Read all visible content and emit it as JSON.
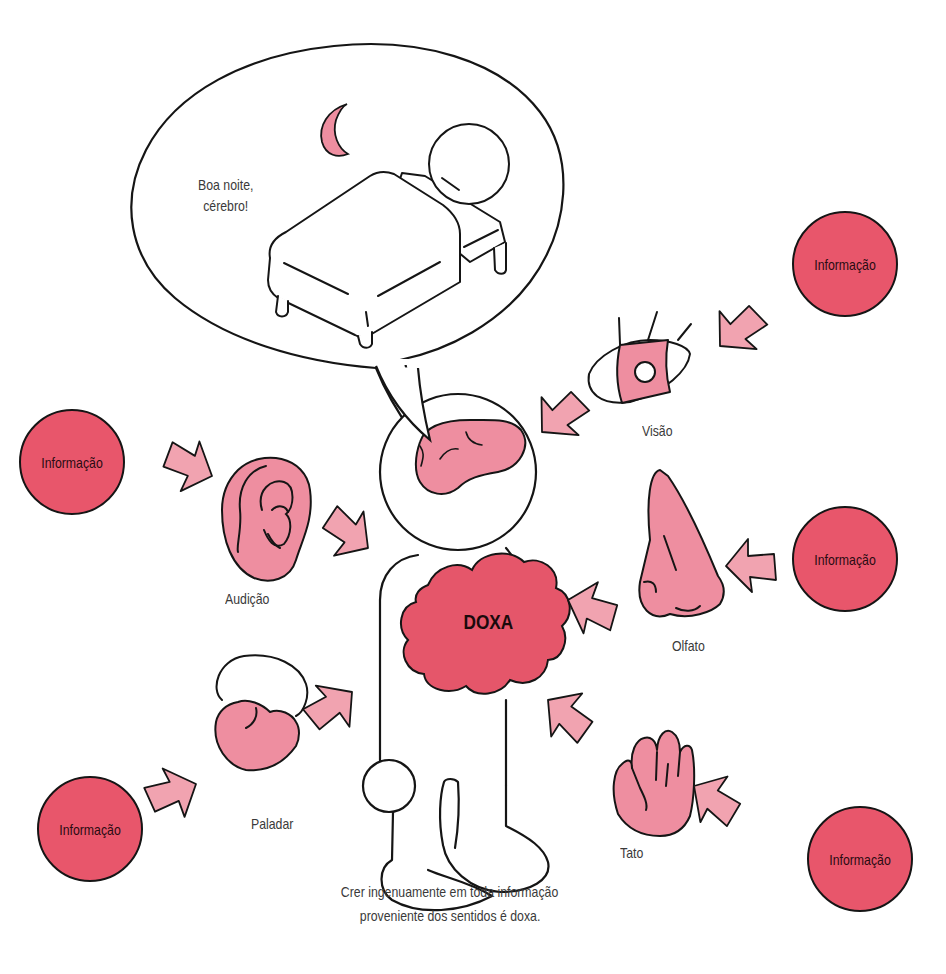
{
  "colors": {
    "info_fill": "#e8566b",
    "doxa_fill": "#e5566a",
    "organ_fill": "#f1a3b0",
    "arrow_fill": "#f1a3b0",
    "stroke": "#151515",
    "text": "#3a3a3a"
  },
  "bubble": {
    "line1": "Boa noite,",
    "line2": "cérebro!"
  },
  "center": {
    "label": "DOXA"
  },
  "senses": [
    {
      "id": "visao",
      "label": "Visão",
      "organ": "eye",
      "source": "Informação"
    },
    {
      "id": "audicao",
      "label": "Audição",
      "organ": "ear",
      "source": "Informação"
    },
    {
      "id": "olfato",
      "label": "Olfato",
      "organ": "nose",
      "source": "Informação"
    },
    {
      "id": "paladar",
      "label": "Paladar",
      "organ": "tongue",
      "source": "Informação"
    },
    {
      "id": "tato",
      "label": "Tato",
      "organ": "hand",
      "source": "Informação"
    }
  ],
  "caption": {
    "line1": "Crer ingenuamente em toda informação",
    "line2": "proveniente dos sentidos é doxa."
  }
}
